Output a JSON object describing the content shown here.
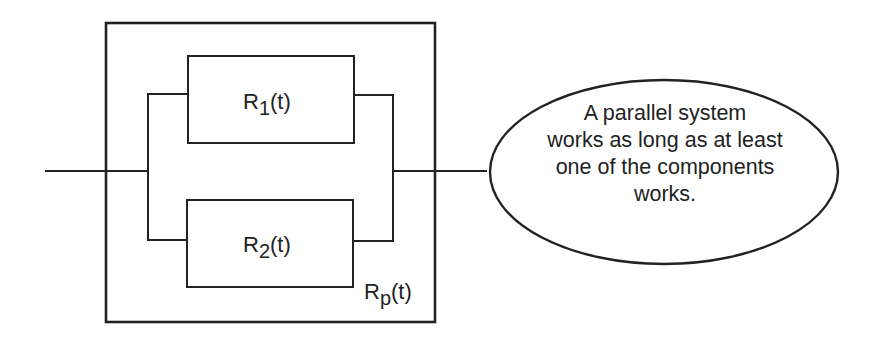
{
  "diagram": {
    "type": "reliability block diagram",
    "title": "Parallel system",
    "colors": {
      "stroke": "#222222",
      "background": "#ffffff"
    },
    "components": [
      {
        "id": "r1",
        "label_main": "R",
        "label_sub": "1",
        "label_tail": "(t)"
      },
      {
        "id": "r2",
        "label_main": "R",
        "label_sub": "2",
        "label_tail": "(t)"
      }
    ],
    "system": {
      "label_main": "R",
      "label_sub": "p",
      "label_tail": "(t)"
    },
    "callout": {
      "lines": [
        "A parallel system",
        "works as long as at least",
        "one of the components",
        "works."
      ]
    }
  }
}
